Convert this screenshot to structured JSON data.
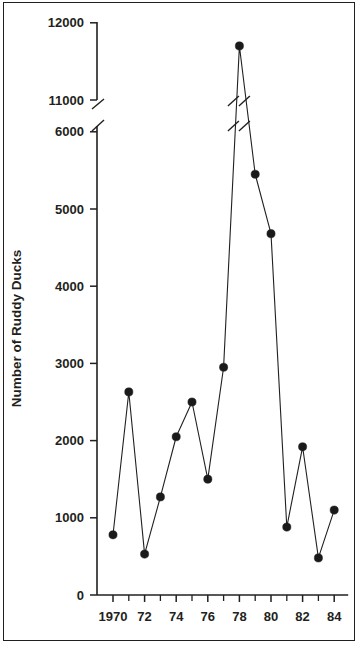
{
  "figure": {
    "background_color": "#ffffff",
    "frame_color": "#231f20",
    "line_color": "#231f20",
    "marker_color": "#1a1a1a"
  },
  "chart_data": {
    "type": "line",
    "title": "",
    "subtitle": "",
    "xlabel": "",
    "ylabel": "Number of Ruddy Ducks",
    "x": [
      1970,
      1971,
      1972,
      1973,
      1974,
      1975,
      1976,
      1977,
      1978,
      1979,
      1980,
      1981,
      1982,
      1983,
      1984
    ],
    "values": [
      780,
      2630,
      530,
      1270,
      2050,
      2500,
      1500,
      2950,
      11700,
      5450,
      4680,
      880,
      1920,
      480,
      1100
    ],
    "series": [
      {
        "name": "Number of Ruddy Ducks",
        "values": [
          780,
          2630,
          530,
          1270,
          2050,
          2500,
          1500,
          2950,
          11700,
          5450,
          4680,
          880,
          1920,
          480,
          1100
        ]
      }
    ],
    "marker": "filled-circle",
    "grid": false,
    "legend": "none",
    "xlim": [
      1969.5,
      1984.5
    ],
    "ylim": [
      0,
      12000
    ],
    "y_axis_break": {
      "present": true,
      "lower_value": 6000,
      "upper_value": 11000,
      "style": "double-slash"
    },
    "ytick_labels": [
      "0",
      "1000",
      "2000",
      "3000",
      "4000",
      "5000",
      "6000",
      "11000",
      "12000"
    ],
    "ytick_values": [
      0,
      1000,
      2000,
      3000,
      4000,
      5000,
      6000,
      11000,
      12000
    ],
    "xtick_labels": [
      "1970",
      "72",
      "74",
      "76",
      "78",
      "80",
      "82",
      "84"
    ],
    "xtick_values": [
      1970,
      1972,
      1974,
      1976,
      1978,
      1980,
      1982,
      1984
    ],
    "xtick_minor_values": [
      1971,
      1973,
      1975,
      1977,
      1979,
      1981,
      1983
    ]
  }
}
